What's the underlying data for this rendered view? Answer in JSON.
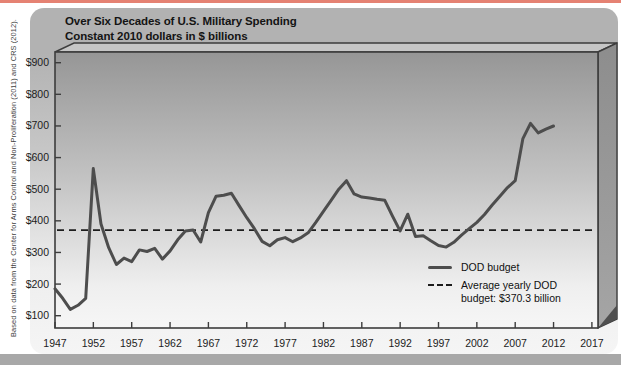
{
  "source_note": "Based on data from the Center for Arms Control and Non-Proliferation (2011) and CRS (2012).",
  "header": {
    "title": "Over Six Decades of U.S. Military Spending",
    "subtitle": "Constant 2010 dollars in $ billions"
  },
  "legend": {
    "dod_label": "DOD budget",
    "avg_label": "Average yearly DOD budget: $370.3 billion"
  },
  "colors": {
    "accent_strip": "#e58273",
    "dod_line": "#4d4d4d",
    "avg_line": "#1c1c1c",
    "card_gray": "#b2b2b2"
  },
  "chart_data": {
    "type": "line",
    "title": "Over Six Decades of U.S. Military Spending",
    "subtitle": "Constant 2010 dollars in $ billions",
    "xlabel": "",
    "ylabel": "$ billions (constant 2010 dollars)",
    "xlim": [
      1947,
      2017
    ],
    "ylim": [
      60,
      935
    ],
    "grid": false,
    "legend_position": "inside bottom-right",
    "x_tick_values": [
      1947,
      1952,
      1957,
      1962,
      1967,
      1972,
      1977,
      1982,
      1987,
      1992,
      1997,
      2002,
      2007,
      2012,
      2017
    ],
    "x_tick_labels": [
      "1947",
      "1952",
      "1957",
      "1962",
      "1967",
      "1972",
      "1977",
      "1982",
      "1987",
      "1992",
      "1997",
      "2002",
      "2007",
      "2012",
      "2017"
    ],
    "y_tick_values": [
      100,
      200,
      300,
      400,
      500,
      600,
      700,
      800,
      900
    ],
    "y_tick_labels": [
      "$100",
      "$200",
      "$300",
      "$400",
      "$500",
      "$600",
      "$700",
      "$800",
      "$900"
    ],
    "average_value": 370.3,
    "average_label": "Average yearly DOD budget: $370.3 billion",
    "x": [
      1947,
      1948,
      1949,
      1950,
      1951,
      1952,
      1953,
      1954,
      1955,
      1956,
      1957,
      1958,
      1959,
      1960,
      1961,
      1962,
      1963,
      1964,
      1965,
      1966,
      1967,
      1968,
      1969,
      1970,
      1971,
      1972,
      1973,
      1974,
      1975,
      1976,
      1977,
      1978,
      1979,
      1980,
      1981,
      1982,
      1983,
      1984,
      1985,
      1986,
      1987,
      1988,
      1989,
      1990,
      1991,
      1992,
      1993,
      1994,
      1995,
      1996,
      1997,
      1998,
      1999,
      2000,
      2001,
      2002,
      2003,
      2004,
      2005,
      2006,
      2007,
      2008,
      2009,
      2010,
      2011,
      2012
    ],
    "series": [
      {
        "name": "DOD budget",
        "values": [
          185,
          155,
          120,
          133,
          155,
          565,
          390,
          315,
          262,
          282,
          271,
          308,
          303,
          313,
          279,
          305,
          340,
          368,
          371,
          333,
          426,
          478,
          481,
          487,
          448,
          410,
          375,
          335,
          321,
          340,
          347,
          334,
          346,
          362,
          395,
          430,
          465,
          500,
          527,
          485,
          475,
          472,
          468,
          465,
          415,
          368,
          421,
          350,
          353,
          337,
          322,
          317,
          332,
          355,
          375,
          395,
          420,
          450,
          478,
          505,
          527,
          660,
          708,
          678,
          690,
          700
        ]
      }
    ]
  }
}
